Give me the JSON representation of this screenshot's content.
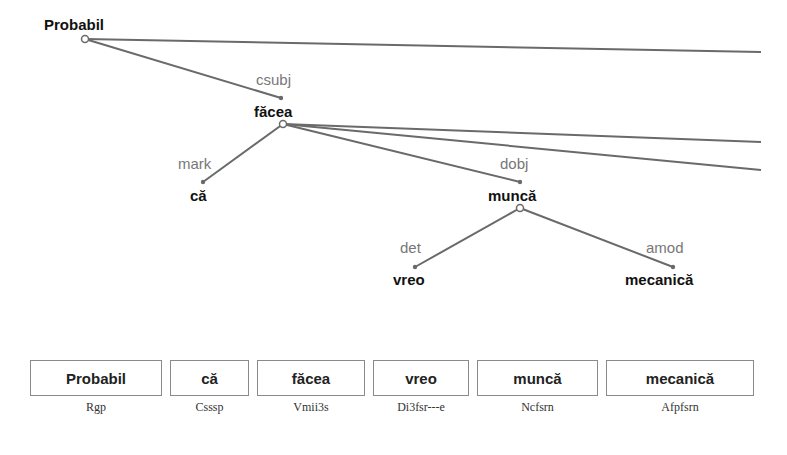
{
  "tree": {
    "nodes": [
      {
        "id": "probabil",
        "word": "Probabil",
        "x": 85,
        "y": 28
      },
      {
        "id": "facea",
        "word": "făcea",
        "x": 281,
        "y": 113,
        "relation": "csubj"
      },
      {
        "id": "ca",
        "word": "că",
        "x": 203,
        "y": 198,
        "relation": "mark"
      },
      {
        "id": "munca",
        "word": "muncă",
        "x": 520,
        "y": 198,
        "relation": "dobj"
      },
      {
        "id": "vreo",
        "word": "vreo",
        "x": 413,
        "y": 282,
        "relation": "det"
      },
      {
        "id": "mecanica",
        "word": "mecanică",
        "x": 673,
        "y": 282,
        "relation": "amod"
      }
    ],
    "labels": {
      "probabil": "Probabil",
      "facea": "făcea",
      "ca": "că",
      "munca": "muncă",
      "vreo": "vreo",
      "mecanica": "mecanică",
      "rel_csubj": "csubj",
      "rel_mark": "mark",
      "rel_dobj": "dobj",
      "rel_det": "det",
      "rel_amod": "amod"
    }
  },
  "tokens": [
    {
      "word": "Probabil",
      "tag": "Rgp"
    },
    {
      "word": "că",
      "tag": "Csssp"
    },
    {
      "word": "făcea",
      "tag": "Vmii3s"
    },
    {
      "word": "vreo",
      "tag": "Di3fsr---e"
    },
    {
      "word": "muncă",
      "tag": "Ncfsrn"
    },
    {
      "word": "mecanică",
      "tag": "Afpfsrn"
    }
  ],
  "colors": {
    "edge": "#6a6a6a",
    "word": "#111111",
    "relation": "#777777",
    "box_border": "#8a8a8a"
  }
}
